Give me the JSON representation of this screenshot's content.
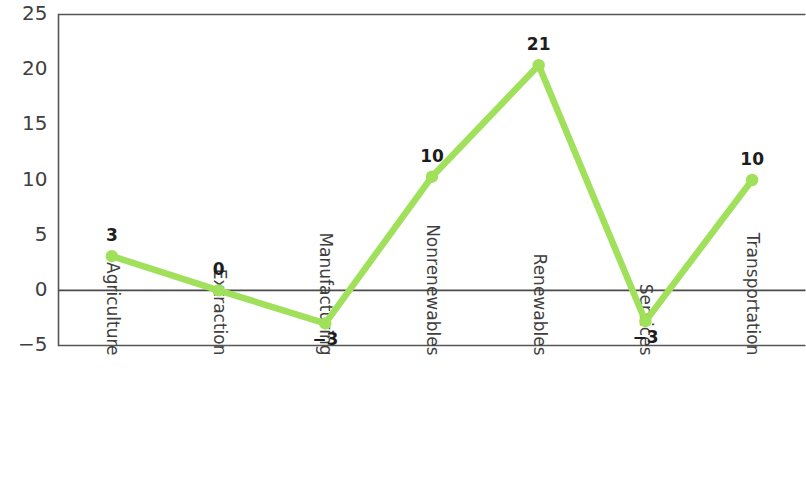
{
  "chart_data": {
    "type": "line",
    "title": "",
    "subtitle": "",
    "xlabel": "",
    "ylabel": "",
    "categories": [
      "Agriculture",
      "Extraction",
      "Manufacturing",
      "Nonrenewables",
      "Renewables",
      "Services",
      "Transportation"
    ],
    "values": [
      3,
      0,
      -3,
      10,
      21,
      -3,
      10
    ],
    "plotted_values": [
      3.1,
      0,
      -3.0,
      10.3,
      20.4,
      -2.8,
      10.0
    ],
    "point_labels": [
      "3",
      "0",
      "−3",
      "10",
      "21",
      "−3",
      "10"
    ],
    "series": [
      {
        "name": "",
        "values": [
          3,
          0,
          -3,
          10,
          21,
          -3,
          10
        ],
        "color": "#a0e05a"
      }
    ],
    "ylim": [
      -5,
      25
    ],
    "ytick_values": [
      25,
      20,
      15,
      10,
      5,
      0,
      -5
    ],
    "ytick_labels": [
      "25",
      "20",
      "15",
      "10",
      "5",
      "0",
      "−5"
    ],
    "grid": false,
    "zero_line": true,
    "legend": false,
    "legend_position": "none",
    "marker": "circle",
    "xtick_rotation": 90,
    "colors": {
      "series": "#a0e05a",
      "axis": "#555555",
      "zero_line": "#4a4a4a",
      "tick_text": "#3f3f3f",
      "label_text": "#1d1d1d",
      "background": "#ffffff"
    }
  }
}
